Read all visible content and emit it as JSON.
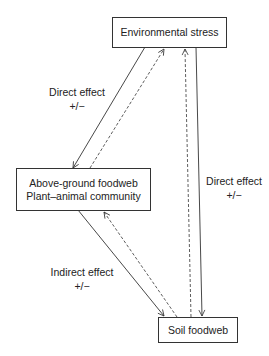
{
  "nodes": {
    "environmental_stress": {
      "label": "Environmental stress"
    },
    "above_ground": {
      "lines": [
        "Above-ground foodweb",
        "Plant–animal community"
      ]
    },
    "soil_foodweb": {
      "label": "Soil foodweb"
    }
  },
  "edge_labels": {
    "stress_to_above": {
      "title": "Direct effect",
      "sign": "+/−"
    },
    "stress_to_soil": {
      "title": "Direct effect",
      "sign": "+/−"
    },
    "above_to_soil": {
      "title": "Indirect effect",
      "sign": "+/−"
    }
  },
  "edges": [
    {
      "from": "environmental_stress",
      "to": "above_ground",
      "style": "solid"
    },
    {
      "from": "above_ground",
      "to": "environmental_stress",
      "style": "dashed"
    },
    {
      "from": "environmental_stress",
      "to": "soil_foodweb",
      "style": "solid"
    },
    {
      "from": "soil_foodweb",
      "to": "environmental_stress",
      "style": "dashed"
    },
    {
      "from": "above_ground",
      "to": "soil_foodweb",
      "style": "solid"
    },
    {
      "from": "soil_foodweb",
      "to": "above_ground",
      "style": "dashed"
    }
  ]
}
